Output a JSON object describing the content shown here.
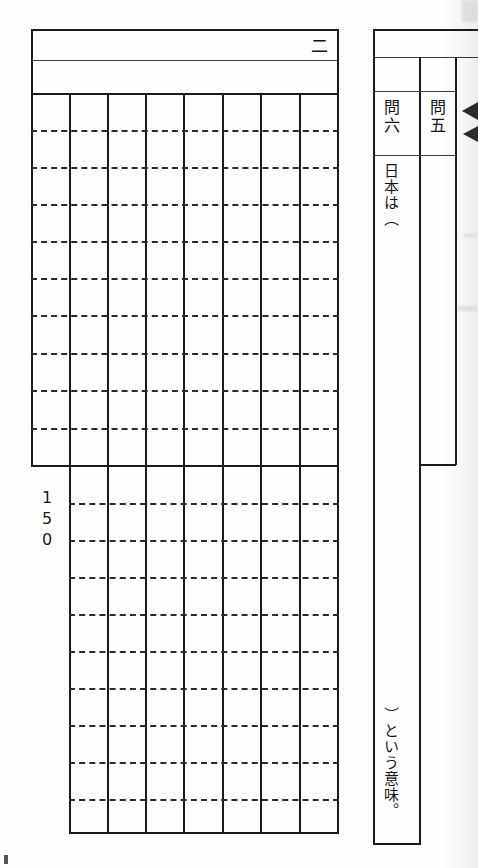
{
  "document": {
    "type": "japanese-exam-answer-sheet",
    "orientation": "vertical-writing",
    "background_color": "#fefefe",
    "rule_color": "#1b1b1b"
  },
  "left_sheet": {
    "name": "composition-answer-grid",
    "section_label": "二",
    "char_count_label": {
      "digits": [
        "1",
        "5",
        "0"
      ],
      "value": "150"
    },
    "upper_grid": {
      "columns": 8,
      "rows": 10
    },
    "lower_grid": {
      "columns": 7,
      "rows": 10
    }
  },
  "right_strip": {
    "name": "short-answer-columns",
    "questions": [
      {
        "label": "問六",
        "answer_top": "日本は（",
        "answer_bottom": "）という意味。"
      },
      {
        "label": "問五",
        "answer_top": "",
        "answer_bottom": ""
      }
    ]
  }
}
